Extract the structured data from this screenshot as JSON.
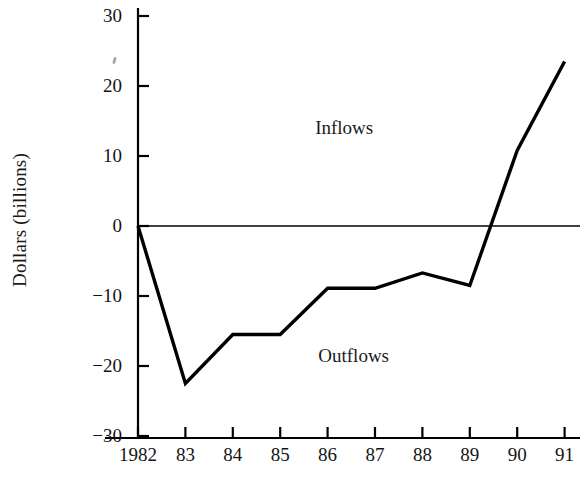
{
  "chart_data": {
    "type": "line",
    "title": "",
    "subtitle": "",
    "xlabel": "",
    "ylabel": "Dollars (billions)",
    "x": [
      1982,
      1983,
      1984,
      1985,
      1986,
      1987,
      1988,
      1989,
      1990,
      1991
    ],
    "categories": [
      "1982",
      "83",
      "84",
      "85",
      "86",
      "87",
      "88",
      "89",
      "90",
      "91"
    ],
    "values": [
      0,
      -22.5,
      -15.5,
      -15.5,
      -8.9,
      -8.9,
      -6.7,
      -8.5,
      10.8,
      23.5
    ],
    "series": [
      {
        "name": "Net capital flows",
        "values": [
          0,
          -22.5,
          -15.5,
          -15.5,
          -8.9,
          -8.9,
          -6.7,
          -8.5,
          10.8,
          23.5
        ],
        "color": "#000000"
      }
    ],
    "ylim": [
      -30,
      30
    ],
    "yticks": [
      30,
      20,
      10,
      0,
      -10,
      -20,
      -30
    ],
    "ytick_labels": [
      "30",
      "20",
      "10",
      "0",
      "−10",
      "−20",
      "−30"
    ],
    "xtick_labels": [
      "1982",
      "83",
      "84",
      "85",
      "86",
      "87",
      "88",
      "89",
      "90",
      "91"
    ],
    "grid": false,
    "legend": "none",
    "zero_line": 0,
    "annotations": [
      {
        "text": "Inflows",
        "x": 1986.35,
        "y": 14.0,
        "region": "above-zero"
      },
      {
        "text": "Outflows",
        "x": 1986.55,
        "y": -18.5,
        "region": "below-zero"
      }
    ],
    "line_color": "#000000",
    "axis_color": "#000000",
    "background_color": "#ffffff"
  }
}
